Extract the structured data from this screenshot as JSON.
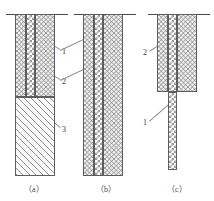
{
  "figure": {
    "panels": [
      {
        "caption": "（a）",
        "caption_x": 24,
        "caption_y": 186,
        "groundline": {
          "x": 6,
          "y": 14,
          "w": 62
        },
        "column": {
          "x": 15,
          "y": 14,
          "w": 40,
          "h": 162
        },
        "segments": [
          {
            "name": "left-soil-band",
            "texture": "tex-soil",
            "x": 15,
            "y": 14,
            "w": 11,
            "h": 83
          },
          {
            "name": "core-band",
            "texture": "tex-check",
            "x": 26,
            "y": 14,
            "w": 9,
            "h": 83
          },
          {
            "name": "right-soil-band",
            "texture": "tex-soil",
            "x": 35,
            "y": 14,
            "w": 20,
            "h": 83
          },
          {
            "name": "concrete-pile",
            "texture": "tex-hatch",
            "x": 15,
            "y": 97,
            "w": 40,
            "h": 79
          }
        ],
        "labels": [
          {
            "text": "1",
            "x": 62,
            "y": 48
          },
          {
            "text": "2",
            "x": 62,
            "y": 78
          },
          {
            "text": "3",
            "x": 62,
            "y": 126
          }
        ],
        "leaders": [
          {
            "x1": 60,
            "y1": 50,
            "x2": 31,
            "y2": 33
          },
          {
            "x1": 60,
            "y1": 80,
            "x2": 31,
            "y2": 63
          },
          {
            "x1": 60,
            "y1": 128,
            "x2": 36,
            "y2": 108
          }
        ]
      },
      {
        "caption": "（b）",
        "caption_x": 96,
        "caption_y": 186,
        "groundline": {
          "x": 74,
          "y": 14,
          "w": 62
        },
        "column": {
          "x": 83,
          "y": 14,
          "w": 40,
          "h": 162
        },
        "segments": [
          {
            "name": "left-soil-band",
            "texture": "tex-soil",
            "x": 83,
            "y": 14,
            "w": 11,
            "h": 162
          },
          {
            "name": "core-band",
            "texture": "tex-check",
            "x": 94,
            "y": 14,
            "w": 9,
            "h": 162
          },
          {
            "name": "right-soil-band",
            "texture": "tex-soil",
            "x": 103,
            "y": 14,
            "w": 20,
            "h": 162
          }
        ],
        "labels": [],
        "leaders": [
          {
            "x1": 60,
            "y1": 50,
            "x2": 96,
            "y2": 33
          },
          {
            "x1": 60,
            "y1": 80,
            "x2": 96,
            "y2": 63
          }
        ]
      },
      {
        "caption": "（c）",
        "caption_x": 167,
        "caption_y": 186,
        "groundline": {
          "x": 148,
          "y": 14,
          "w": 62
        },
        "column": {
          "x": 157,
          "y": 14,
          "w": 40,
          "h": 78
        },
        "segments": [
          {
            "name": "left-soil-band",
            "texture": "tex-soil",
            "x": 157,
            "y": 14,
            "w": 11,
            "h": 78
          },
          {
            "name": "core-band-upper",
            "texture": "tex-check",
            "x": 168,
            "y": 14,
            "w": 9,
            "h": 78
          },
          {
            "name": "right-soil-band",
            "texture": "tex-soil",
            "x": 177,
            "y": 14,
            "w": 20,
            "h": 78
          },
          {
            "name": "core-band-lower",
            "texture": "tex-check",
            "x": 168,
            "y": 92,
            "w": 9,
            "h": 78
          }
        ],
        "labels": [
          {
            "text": "2",
            "x": 143,
            "y": 49
          },
          {
            "text": "1",
            "x": 143,
            "y": 119
          }
        ],
        "leaders": [
          {
            "x1": 149,
            "y1": 51,
            "x2": 171,
            "y2": 37
          },
          {
            "x1": 149,
            "y1": 121,
            "x2": 172,
            "y2": 101
          }
        ]
      }
    ]
  }
}
